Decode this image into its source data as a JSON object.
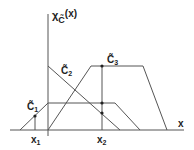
{
  "diagram": {
    "y_axis_label": "χ",
    "y_axis_sub": "C̃",
    "y_axis_arg": "(x)",
    "x_axis_label": "x",
    "sets": [
      {
        "name": "C̃",
        "sub": "1",
        "points": [
          [
            20,
            130
          ],
          [
            48,
            103
          ],
          [
            115,
            103
          ],
          [
            140,
            130
          ]
        ]
      },
      {
        "name": "C̃",
        "sub": "2",
        "points": [
          [
            48,
            66
          ],
          [
            120,
            130
          ]
        ]
      },
      {
        "name": "C̃",
        "sub": "3",
        "points": [
          [
            48,
            130
          ],
          [
            91,
            66
          ],
          [
            143,
            66
          ],
          [
            167,
            130
          ]
        ]
      }
    ],
    "markers": [
      {
        "label": "x",
        "sub": "1",
        "x": 35
      },
      {
        "label": "x",
        "sub": "2",
        "x": 102
      }
    ],
    "colors": {
      "line": "#555555",
      "text": "#222222"
    }
  }
}
